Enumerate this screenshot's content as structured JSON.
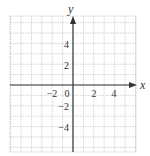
{
  "diagram": {
    "type": "coordinate-grid",
    "axes": {
      "x_label": "x",
      "y_label": "y",
      "x_range": [
        -6,
        6
      ],
      "y_range": [
        -6.5,
        6.5
      ],
      "grid_step": 1,
      "label_step": 2
    },
    "x_ticks": [
      {
        "value": -2,
        "label": "−2"
      },
      {
        "value": 0,
        "label": "0"
      },
      {
        "value": 2,
        "label": "2"
      },
      {
        "value": 4,
        "label": "4"
      }
    ],
    "y_ticks": [
      {
        "value": 4,
        "label": "4"
      },
      {
        "value": 2,
        "label": "2"
      },
      {
        "value": -2,
        "label": "−2"
      },
      {
        "value": -4,
        "label": "−4"
      }
    ],
    "colors": {
      "grid": "#b8b8b8",
      "axis": "#333333",
      "text": "#333333"
    }
  }
}
